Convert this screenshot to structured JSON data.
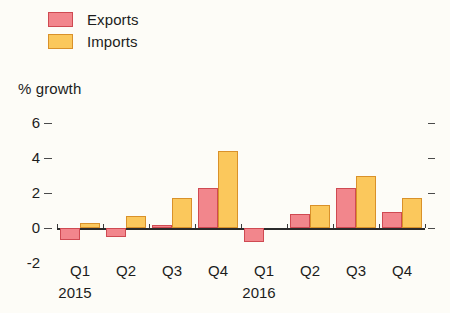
{
  "legend": {
    "items": [
      {
        "label": "Exports",
        "color": "#f2868c",
        "border": "#cf4a52"
      },
      {
        "label": "Imports",
        "color": "#fbc85c",
        "border": "#d9912a"
      }
    ]
  },
  "axis_title": "% growth",
  "chart_data": {
    "type": "bar",
    "title": "",
    "subtitle": "",
    "xlabel": "",
    "ylabel": "% growth",
    "ylim": [
      -2,
      6
    ],
    "yticks": [
      -2,
      0,
      2,
      4,
      6
    ],
    "ytick_labels": [
      "-2",
      "0",
      "2",
      "4",
      "6"
    ],
    "grid": false,
    "legend_position": "top-left",
    "categories": [
      "Q1",
      "Q2",
      "Q3",
      "Q4",
      "Q1",
      "Q2",
      "Q3",
      "Q4"
    ],
    "group_labels": [
      {
        "label": "2015",
        "span_start": 0,
        "span_end": 3
      },
      {
        "label": "2016",
        "span_start": 4,
        "span_end": 7
      }
    ],
    "series": [
      {
        "name": "Exports",
        "color": "#f2868c",
        "values": [
          -0.7,
          -0.5,
          0.15,
          2.3,
          -0.8,
          0.8,
          2.3,
          0.9
        ]
      },
      {
        "name": "Imports",
        "color": "#fbc85c",
        "values": [
          0.3,
          0.7,
          1.7,
          4.4,
          0.0,
          1.3,
          3.0,
          1.7
        ]
      }
    ]
  }
}
